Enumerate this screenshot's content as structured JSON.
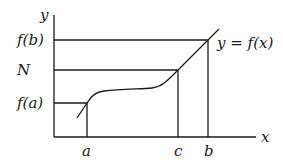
{
  "diagram": {
    "type": "function-graph",
    "axes": {
      "x_label": "x",
      "y_label": "y"
    },
    "curve_label": "y = f(x)",
    "y_levels": [
      {
        "id": "fb",
        "label": "f(b)"
      },
      {
        "id": "N",
        "label": "N"
      },
      {
        "id": "fa",
        "label": "f(a)"
      }
    ],
    "x_points": [
      {
        "id": "a",
        "label": "a"
      },
      {
        "id": "c",
        "label": "c"
      },
      {
        "id": "b",
        "label": "b"
      }
    ]
  }
}
